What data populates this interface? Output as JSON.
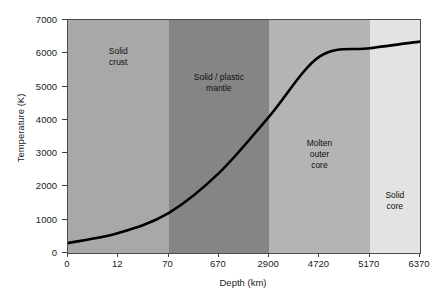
{
  "chart_data": {
    "type": "line",
    "title": "",
    "xlabel": "Depth (km)",
    "ylabel": "Temperature (K)",
    "x_tick_labels": [
      "0",
      "12",
      "70",
      "670",
      "2900",
      "4720",
      "5170",
      "6370"
    ],
    "x_tick_values": [
      0,
      12,
      70,
      670,
      2900,
      4720,
      5170,
      6370
    ],
    "x_axis_scale": "categorical-even-spacing",
    "y_tick_labels": [
      "0",
      "1000",
      "2000",
      "3000",
      "4000",
      "5000",
      "6000",
      "7000"
    ],
    "y_tick_values": [
      0,
      1000,
      2000,
      3000,
      4000,
      5000,
      6000,
      7000
    ],
    "ylim": [
      0,
      7000
    ],
    "grid": false,
    "legend": "none",
    "series": [
      {
        "name": "Temperature profile",
        "color": "#000000",
        "points": [
          {
            "depth_km": 0,
            "temperature_k": 300,
            "tick_index": 0
          },
          {
            "depth_km": 12,
            "temperature_k": 600,
            "tick_index": 1
          },
          {
            "depth_km": 70,
            "temperature_k": 1200,
            "tick_index": 2
          },
          {
            "depth_km": 670,
            "temperature_k": 2400,
            "tick_index": 3
          },
          {
            "depth_km": 2900,
            "temperature_k": 4100,
            "tick_index": 4
          },
          {
            "depth_km": 4720,
            "temperature_k": 5900,
            "tick_index": 5
          },
          {
            "depth_km": 5170,
            "temperature_k": 6150,
            "tick_index": 6
          },
          {
            "depth_km": 6370,
            "temperature_k": 6350,
            "tick_index": 7
          }
        ]
      }
    ],
    "regions": [
      {
        "name": "Solid crust",
        "label": "Solid\ncrust",
        "start_km": 0,
        "end_km": 70,
        "start_tick_index": 0,
        "end_tick_index": 2,
        "color": "#a8a8a8"
      },
      {
        "name": "Solid / plastic mantle",
        "label": "Solid / plastic\nmantle",
        "start_km": 70,
        "end_km": 2900,
        "start_tick_index": 2,
        "end_tick_index": 4,
        "color": "#858585"
      },
      {
        "name": "Molten outer core",
        "label": "Molten\nouter\ncore",
        "start_km": 2900,
        "end_km": 5170,
        "start_tick_index": 4,
        "end_tick_index": 6,
        "color": "#b4b4b4"
      },
      {
        "name": "Solid core",
        "label": "Solid\ncore",
        "start_km": 5170,
        "end_km": 6370,
        "start_tick_index": 6,
        "end_tick_index": 7,
        "color": "#e3e3e3"
      }
    ]
  },
  "axes": {
    "frame_color": "#4d4d4d",
    "tick_color": "#3f3f3f",
    "background": "#ffffff"
  },
  "region_labels": {
    "crust_line1": "Solid",
    "crust_line2": "crust",
    "mantle_line1": "Solid / plastic",
    "mantle_line2": "mantle",
    "outer_core_line1": "Molten",
    "outer_core_line2": "outer",
    "outer_core_line3": "core",
    "inner_core_line1": "Solid",
    "inner_core_line2": "core"
  }
}
